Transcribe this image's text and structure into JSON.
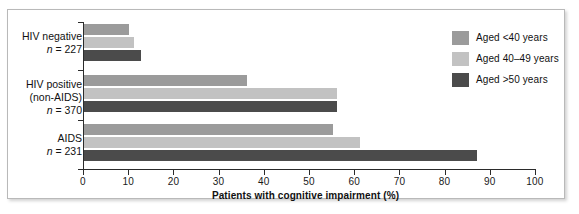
{
  "chart_data": {
    "type": "bar",
    "orientation": "horizontal",
    "title": "",
    "xlabel": "Patients with cognitive impairment (%)",
    "ylabel": "",
    "xlim": [
      0,
      100
    ],
    "xticks": [
      0,
      10,
      20,
      30,
      40,
      50,
      60,
      70,
      80,
      90,
      100
    ],
    "xtick_labels": [
      "0",
      "10",
      "20",
      "30",
      "40",
      "50",
      "60",
      "70",
      "80",
      "90",
      "100"
    ],
    "grid": false,
    "legend_position": "top-right",
    "categories": [
      "HIV negative n = 227",
      "HIV positive (non-AIDS) n = 370",
      "AIDS n = 231"
    ],
    "category_labels": [
      {
        "line1": "HIV negative",
        "line2": "n = 227",
        "n": 227
      },
      {
        "line1": "HIV positive",
        "line2": "(non-AIDS)",
        "line3": "n = 370",
        "n": 370
      },
      {
        "line1": "AIDS",
        "line2": "n = 231",
        "n": 231
      }
    ],
    "series": [
      {
        "name": "Aged <40 years",
        "color": "#9b9b9b",
        "values": [
          10,
          36,
          55
        ]
      },
      {
        "name": "Aged 40–49 years",
        "color": "#c2c2c2",
        "values": [
          11,
          56,
          61
        ]
      },
      {
        "name": "Aged >50 years",
        "color": "#4b4b4b",
        "values": [
          12.5,
          56,
          87
        ]
      }
    ],
    "legend": [
      {
        "label": "Aged <40 years",
        "color": "#9b9b9b"
      },
      {
        "label": "Aged 40–49 years",
        "color": "#c2c2c2"
      },
      {
        "label": "Aged >50 years",
        "color": "#4b4b4b"
      }
    ]
  },
  "colors": {
    "series_1": "#9b9b9b",
    "series_2": "#c2c2c2",
    "series_3": "#4b4b4b",
    "axis": "#2b2b2b",
    "frame": "#b9b9b9",
    "background": "#ffffff"
  }
}
